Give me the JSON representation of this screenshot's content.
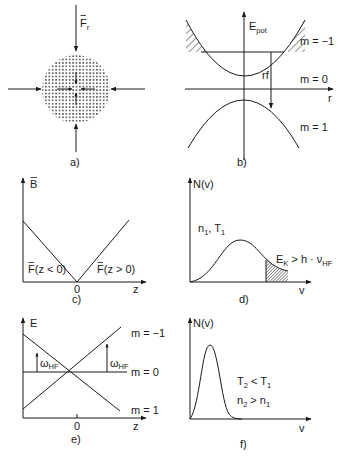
{
  "figure": {
    "panels": [
      {
        "id": "a",
        "caption": "a)",
        "force_label": "F",
        "force_subscript": "r",
        "description": "Dotted atom cloud with radial inward force arrows"
      },
      {
        "id": "b",
        "caption": "b)",
        "y_axis_label": "E",
        "y_axis_subscript": "pot",
        "x_axis_label": "r",
        "levels": [
          "m = −1",
          "m = 0",
          "m = 1"
        ],
        "transition_label": "rf"
      },
      {
        "id": "c",
        "caption": "c)",
        "y_axis_label": "B",
        "x_axis_label": "z",
        "origin_tick": "0",
        "left_annotation": "F(z < 0)",
        "right_annotation": "F(z > 0)"
      },
      {
        "id": "d",
        "caption": "d)",
        "y_axis_label": "N(v)",
        "x_axis_label": "v",
        "params_n": "n",
        "params_n_sub": "1",
        "params_T": "T",
        "params_T_sub": "1",
        "cut_label_main": "E",
        "cut_label_sub1": "K",
        "cut_label_mid": " > h · ν",
        "cut_label_sub2": "HF"
      },
      {
        "id": "e",
        "caption": "e)",
        "y_axis_label": "E",
        "x_axis_label": "z",
        "origin_tick": "0",
        "levels": [
          "m = −1",
          "m = 0",
          "m = 1"
        ],
        "transition_main": "ω",
        "transition_sub": "HF"
      },
      {
        "id": "f",
        "caption": "f)",
        "y_axis_label": "N(v)",
        "x_axis_label": "v",
        "cond1_main": "T",
        "cond1_sub": "2",
        "cond1_rel": " < T",
        "cond1_sub2": "1",
        "cond2_main": "n",
        "cond2_sub": "2",
        "cond2_rel": " > n",
        "cond2_sub2": "1"
      }
    ],
    "colors": {
      "ink": "#1a1a1a",
      "background": "#ffffff"
    }
  }
}
